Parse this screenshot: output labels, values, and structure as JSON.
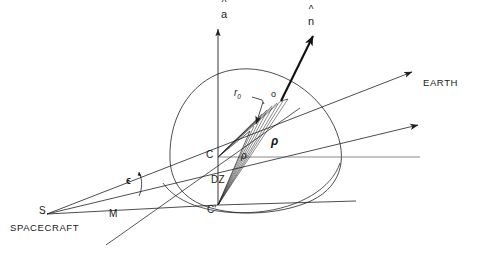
{
  "figure": {
    "type": "vector-geometry-diagram",
    "title": ""
  },
  "labels": {
    "axis_a": {
      "text": "a",
      "accent": "^",
      "x": 224,
      "y": 12
    },
    "normal_n": {
      "text": "n",
      "accent": "^",
      "x": 310,
      "y": 19
    },
    "r_zero": {
      "base": "r",
      "subscript": "0",
      "x": 236,
      "y": 90
    },
    "point_o": {
      "text": "o",
      "x": 272,
      "y": 92
    },
    "rho_small": {
      "text": "ρ",
      "x": 243,
      "y": 154
    },
    "rho_large": {
      "text": "ρ",
      "x": 273,
      "y": 140
    },
    "point_c": {
      "text": "C",
      "x": 208,
      "y": 152
    },
    "point_c_prime": {
      "text": "C'",
      "x": 209,
      "y": 206
    },
    "dz": {
      "text": "DZ",
      "x": 212,
      "y": 176
    },
    "epsilon": {
      "text": "ϵ",
      "x": 128,
      "y": 178
    },
    "point_s": {
      "text": "S",
      "x": 41,
      "y": 208
    },
    "point_m": {
      "text": "M",
      "x": 110,
      "y": 211
    },
    "spacecraft": {
      "text": "SPACECRAFT",
      "x": 10,
      "y": 224
    },
    "earth": {
      "text": "EARTH",
      "x": 424,
      "y": 79
    }
  },
  "geometry": {
    "points": {
      "S": [
        47,
        214
      ],
      "M": [
        117,
        214
      ],
      "C": [
        218,
        157
      ],
      "C_prime": [
        218,
        205
      ],
      "o": [
        281,
        101
      ],
      "axis_top": [
        218,
        27
      ],
      "n_tip": [
        312,
        35
      ],
      "earth_arrow_1_tip": [
        414,
        71
      ],
      "earth_arrow_2_tip": [
        420,
        124
      ]
    },
    "colors": {
      "stroke": "#1f1f1f",
      "background": "#ffffff"
    }
  }
}
